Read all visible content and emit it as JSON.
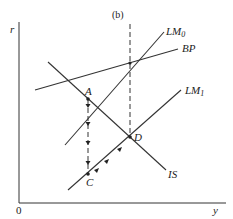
{
  "diagram": {
    "title": "(b)",
    "axes": {
      "y_label": "r",
      "x_label": "y",
      "origin_label": "0"
    },
    "curves": [
      {
        "name": "LM",
        "subscript": "0",
        "label": "LM0"
      },
      {
        "name": "BP",
        "subscript": "",
        "label": "BP"
      },
      {
        "name": "LM",
        "subscript": "1",
        "label": "LM1"
      },
      {
        "name": "IS",
        "subscript": "",
        "label": "IS"
      }
    ],
    "points": [
      {
        "label": "A"
      },
      {
        "label": "C"
      },
      {
        "label": "D"
      }
    ],
    "paths": [
      {
        "description": "dashed vertical adjustment from A down to C",
        "style": "dashed-arrows"
      },
      {
        "description": "adjustment along LM1 from C to D",
        "style": "solid-arrows"
      },
      {
        "description": "dashed vertical from LM0/BP intersection down to D",
        "style": "dashed"
      }
    ],
    "colors": {
      "ink": "#222222",
      "background": "#ffffff"
    }
  }
}
